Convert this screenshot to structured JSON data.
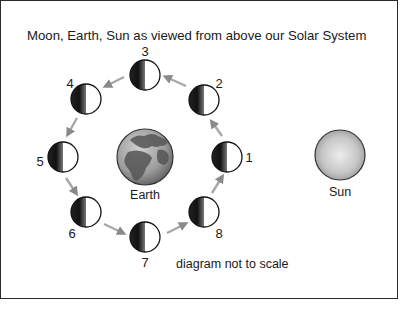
{
  "title": "Moon, Earth, Sun as viewed from above our Solar System",
  "note": "diagram not to scale",
  "earth": {
    "label": "Earth",
    "cx": 145,
    "cy": 157,
    "r": 28
  },
  "sun": {
    "label": "Sun",
    "cx": 340,
    "cy": 155,
    "r": 25
  },
  "moons": [
    {
      "id": "1",
      "cx": 227,
      "cy": 157,
      "lx": 249,
      "ly": 162
    },
    {
      "id": "2",
      "cx": 204,
      "cy": 100,
      "lx": 219,
      "ly": 88
    },
    {
      "id": "3",
      "cx": 145,
      "cy": 75,
      "lx": 145,
      "ly": 56
    },
    {
      "id": "4",
      "cx": 86,
      "cy": 99,
      "lx": 70,
      "ly": 88
    },
    {
      "id": "5",
      "cx": 63,
      "cy": 157,
      "lx": 40,
      "ly": 166
    },
    {
      "id": "6",
      "cx": 86,
      "cy": 212,
      "lx": 72,
      "ly": 238
    },
    {
      "id": "7",
      "cx": 145,
      "cy": 237,
      "lx": 145,
      "ly": 267
    },
    {
      "id": "8",
      "cx": 204,
      "cy": 212,
      "lx": 219,
      "ly": 238
    }
  ],
  "colors": {
    "border": "#2a2a2a",
    "moon_dark": "#111111",
    "moon_light": "#ffffff",
    "arrow": "#9a9a9a",
    "sun_center": "#e8e8e8",
    "sun_edge": "#a8a8a8",
    "earth_ocean": "#8a8a8a",
    "earth_land": "#5a5a5a"
  }
}
